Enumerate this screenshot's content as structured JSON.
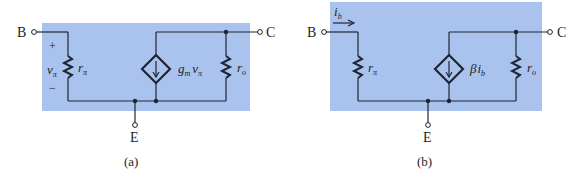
{
  "colors": {
    "panel_fill": "#a9c3ee",
    "wire": "#1f2433",
    "background": "#ffffff"
  },
  "panel_a": {
    "caption": "(a)",
    "terminals": {
      "base": "B",
      "collector": "C",
      "emitter": "E"
    },
    "input_resistor": {
      "symbol": "r",
      "subscript": "π"
    },
    "control_voltage": {
      "symbol": "v",
      "subscript": "π",
      "plus": "+",
      "minus": "−"
    },
    "dependent_source": {
      "gain": "g",
      "gain_sub": "m",
      "var": "v",
      "var_sub": "π"
    },
    "output_resistor": {
      "symbol": "r",
      "subscript": "o"
    }
  },
  "panel_b": {
    "caption": "(b)",
    "terminals": {
      "base": "B",
      "collector": "C",
      "emitter": "E"
    },
    "base_current": {
      "symbol": "i",
      "subscript": "b"
    },
    "input_resistor": {
      "symbol": "r",
      "subscript": "π"
    },
    "dependent_source": {
      "gain": "β",
      "var": "i",
      "var_sub": "b"
    },
    "output_resistor": {
      "symbol": "r",
      "subscript": "o"
    }
  }
}
